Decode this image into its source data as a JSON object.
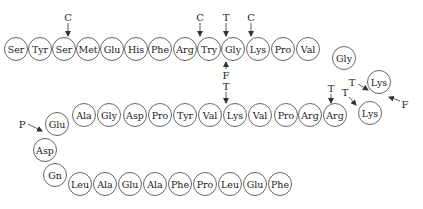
{
  "radius": 11.5,
  "residues": [
    {
      "label": "Ser",
      "x": 16,
      "y": 49
    },
    {
      "label": "Tyr",
      "x": 40,
      "y": 49
    },
    {
      "label": "Ser",
      "x": 64,
      "y": 49
    },
    {
      "label": "Met",
      "x": 88,
      "y": 49
    },
    {
      "label": "Glu",
      "x": 112,
      "y": 49
    },
    {
      "label": "His",
      "x": 136,
      "y": 49
    },
    {
      "label": "Phe",
      "x": 160,
      "y": 49
    },
    {
      "label": "Arg",
      "x": 185,
      "y": 49
    },
    {
      "label": "Try",
      "x": 209,
      "y": 49
    },
    {
      "label": "Gly",
      "x": 233,
      "y": 49
    },
    {
      "label": "Lys",
      "x": 258,
      "y": 49
    },
    {
      "label": "Pro",
      "x": 283,
      "y": 49
    },
    {
      "label": "Val",
      "x": 308,
      "y": 49
    },
    {
      "label": "Gly",
      "x": 344,
      "y": 58
    },
    {
      "label": "Lys",
      "x": 379,
      "y": 82
    },
    {
      "label": "Lys",
      "x": 370,
      "y": 113
    },
    {
      "label": "Arg",
      "x": 335,
      "y": 115
    },
    {
      "label": "Arg",
      "x": 310,
      "y": 115
    },
    {
      "label": "Pro",
      "x": 286,
      "y": 115
    },
    {
      "label": "Val",
      "x": 260,
      "y": 115
    },
    {
      "label": "Lys",
      "x": 235,
      "y": 115
    },
    {
      "label": "Val",
      "x": 210,
      "y": 115
    },
    {
      "label": "Tyr",
      "x": 185,
      "y": 115
    },
    {
      "label": "Pro",
      "x": 160,
      "y": 115
    },
    {
      "label": "Asp",
      "x": 135,
      "y": 115
    },
    {
      "label": "Gly",
      "x": 109,
      "y": 115
    },
    {
      "label": "Ala",
      "x": 84,
      "y": 115
    },
    {
      "label": "Glu",
      "x": 57,
      "y": 124
    },
    {
      "label": "Asp",
      "x": 45,
      "y": 150
    },
    {
      "label": "Gn",
      "x": 55,
      "y": 175
    },
    {
      "label": "Leu",
      "x": 80,
      "y": 184
    },
    {
      "label": "Ala",
      "x": 105,
      "y": 184
    },
    {
      "label": "Glu",
      "x": 130,
      "y": 184
    },
    {
      "label": "Ala",
      "x": 155,
      "y": 184
    },
    {
      "label": "Phe",
      "x": 180,
      "y": 184
    },
    {
      "label": "Pro",
      "x": 205,
      "y": 184
    },
    {
      "label": "Leu",
      "x": 230,
      "y": 184
    },
    {
      "label": "Glu",
      "x": 255,
      "y": 184
    },
    {
      "label": "Phe",
      "x": 280,
      "y": 184
    }
  ],
  "markers": [
    {
      "label": "C",
      "lx": 68,
      "ly": 17,
      "x1": 68,
      "y1": 23,
      "x2": 68,
      "y2": 36
    },
    {
      "label": "C",
      "lx": 200,
      "ly": 17,
      "x1": 200,
      "y1": 23,
      "x2": 200,
      "y2": 36
    },
    {
      "label": "T",
      "lx": 226,
      "ly": 17,
      "x1": 226,
      "y1": 23,
      "x2": 226,
      "y2": 36
    },
    {
      "label": "C",
      "lx": 251,
      "ly": 17,
      "x1": 251,
      "y1": 23,
      "x2": 251,
      "y2": 36
    },
    {
      "label": "F",
      "lx": 226,
      "ly": 75,
      "x1": 226,
      "y1": 69,
      "x2": 226,
      "y2": 62
    },
    {
      "label": "T",
      "lx": 226,
      "ly": 86,
      "x1": 226,
      "y1": 92,
      "x2": 226,
      "y2": 103
    },
    {
      "label": "T",
      "lx": 331,
      "ly": 88,
      "x1": 331,
      "y1": 94,
      "x2": 331,
      "y2": 103
    },
    {
      "label": "T",
      "lx": 345,
      "ly": 92,
      "x1": 349,
      "y1": 97,
      "x2": 356,
      "y2": 105
    },
    {
      "label": "T",
      "lx": 352,
      "ly": 82,
      "x1": 358,
      "y1": 84,
      "x2": 368,
      "y2": 90
    },
    {
      "label": "F",
      "lx": 405,
      "ly": 104,
      "x1": 400,
      "y1": 101,
      "x2": 389,
      "y2": 97
    },
    {
      "label": "P",
      "lx": 22,
      "ly": 124,
      "x1": 28,
      "y1": 124,
      "x2": 42,
      "y2": 131
    }
  ]
}
